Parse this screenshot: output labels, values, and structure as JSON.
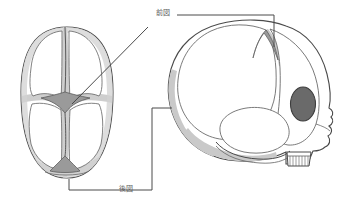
{
  "figure": {
    "background_color": "#ffffff",
    "labels": [
      {
        "id": "anterior-fontanelle",
        "text": "前図",
        "x": 156,
        "y": 9,
        "leader": "horizontal-then-down-to-lateral-view"
      },
      {
        "id": "posterior-fontanelle",
        "text": "後図",
        "x": 119,
        "y": 185,
        "leader": "vertical-then-right"
      }
    ],
    "views": [
      {
        "id": "superior-view",
        "name": "superior-view-skull",
        "description": "top view of infant skull showing anterior and posterior fontanelles and sutures",
        "cx": 67,
        "cy": 103
      },
      {
        "id": "lateral-view",
        "name": "lateral-view-skull",
        "description": "side view of infant skull showing orbit, anterior fontanelle, and jaw",
        "cx": 250,
        "cy": 100
      }
    ],
    "colors": {
      "outline": "#4a4a4a",
      "outline_soft": "#6b6b6b",
      "bone_fill": "#ffffff",
      "suture_shadow": "#c9c9c9",
      "fontanelle_fill": "#9a9a9a",
      "orbit_fill": "#6a6a6a",
      "leader_line": "#4a4a4a",
      "label_text": "#5d5d5d"
    },
    "leaders": {
      "anterior": {
        "x1": 176,
        "y1": 14,
        "x2": 274,
        "y2": 14,
        "x3": 274,
        "y3": 47
      },
      "anterior_diagonal": {
        "x1": 146,
        "y1": 28,
        "x2": 72,
        "y2": 104
      },
      "posterior": {
        "x1": 152,
        "y1": 108,
        "x2": 152,
        "y2": 190,
        "x3": 116,
        "y3": 190
      },
      "posterior_top": {
        "x1": 152,
        "y1": 108,
        "x2": 172,
        "y2": 108
      },
      "posterior_left": {
        "x1": 116,
        "y1": 190,
        "x2": 69,
        "y2": 190,
        "x4": 69,
        "y4": 178
      }
    }
  }
}
